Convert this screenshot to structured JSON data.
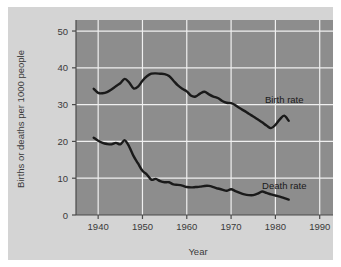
{
  "chart_data": {
    "type": "line",
    "title": "",
    "xlabel": "Year",
    "ylabel": "Births or deaths per 1000 people",
    "xlim": [
      1935,
      1993
    ],
    "ylim": [
      0,
      53
    ],
    "xticks": [
      1940,
      1950,
      1960,
      1970,
      1980,
      1990
    ],
    "xtick_labels": [
      "1940",
      "1950",
      "1960",
      "1970",
      "1980",
      "1990"
    ],
    "yticks": [
      0,
      10,
      20,
      30,
      40,
      50
    ],
    "ytick_labels": [
      "0",
      "10",
      "20",
      "30",
      "40",
      "50"
    ],
    "grid": true,
    "legend_position": "inline-right",
    "plot_background": "#8d8d8d",
    "figure_background": "#d4d4d4",
    "gridline_color": "#f0f0f0",
    "line_color": "#1a1a1a",
    "series": [
      {
        "name": "Birth rate",
        "label": "Birth rate",
        "color": "#1a1a1a",
        "x": [
          1939,
          1940,
          1941,
          1942,
          1943,
          1944,
          1945,
          1946,
          1947,
          1948,
          1949,
          1950,
          1951,
          1952,
          1953,
          1954,
          1955,
          1956,
          1957,
          1958,
          1959,
          1960,
          1961,
          1962,
          1963,
          1964,
          1965,
          1966,
          1967,
          1968,
          1969,
          1970,
          1971,
          1972,
          1973,
          1974,
          1975,
          1976,
          1977,
          1978,
          1979,
          1980,
          1981,
          1982,
          1983
        ],
        "values": [
          34.3,
          33.2,
          33.1,
          33.4,
          34.1,
          35.0,
          35.8,
          37.0,
          36.0,
          34.4,
          34.9,
          36.5,
          37.7,
          38.4,
          38.5,
          38.4,
          38.3,
          37.8,
          36.5,
          35.2,
          34.3,
          33.6,
          32.4,
          32.2,
          33.0,
          33.5,
          32.8,
          32.2,
          31.8,
          31.0,
          30.5,
          30.4,
          29.8,
          29.0,
          28.3,
          27.5,
          26.8,
          26.0,
          25.2,
          24.3,
          23.6,
          24.5,
          26.0,
          27.0,
          25.6
        ]
      },
      {
        "name": "Death rate",
        "label": "Death rate",
        "color": "#1a1a1a",
        "x": [
          1939,
          1940,
          1941,
          1942,
          1943,
          1944,
          1945,
          1946,
          1947,
          1948,
          1949,
          1950,
          1951,
          1952,
          1953,
          1954,
          1955,
          1956,
          1957,
          1958,
          1959,
          1960,
          1961,
          1962,
          1963,
          1964,
          1965,
          1966,
          1967,
          1968,
          1969,
          1970,
          1971,
          1972,
          1973,
          1974,
          1975,
          1976,
          1977,
          1978,
          1979,
          1980,
          1981,
          1982,
          1983
        ],
        "values": [
          21.0,
          20.2,
          19.6,
          19.3,
          19.2,
          19.6,
          19.2,
          20.3,
          18.6,
          16.0,
          14.0,
          12.0,
          11.0,
          9.6,
          9.8,
          9.2,
          8.9,
          8.9,
          8.3,
          8.2,
          8.0,
          7.6,
          7.5,
          7.6,
          7.7,
          7.9,
          7.9,
          7.6,
          7.2,
          6.9,
          6.6,
          7.0,
          6.5,
          6.0,
          5.6,
          5.4,
          5.4,
          5.8,
          6.4,
          6.0,
          5.6,
          5.3,
          5.0,
          4.6,
          4.2
        ]
      }
    ],
    "annotations": [
      {
        "name": "birth-rate-label",
        "text": "Birth rate",
        "x": 1982,
        "y": 30.5
      },
      {
        "name": "death-rate-label",
        "text": "Death rate",
        "x": 1982,
        "y": 7.2
      }
    ]
  }
}
